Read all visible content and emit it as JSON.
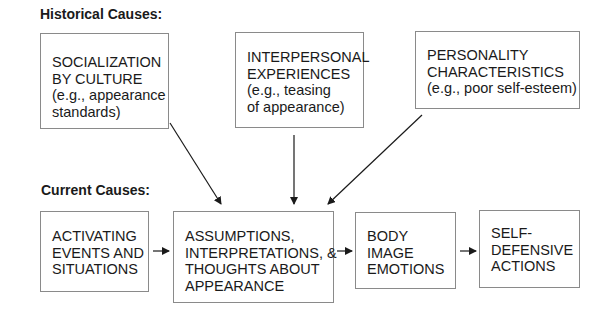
{
  "sections": {
    "historical_label": "Historical Causes:",
    "current_label": "Current Causes:"
  },
  "historical_boxes": [
    {
      "lines": [
        "SOCIALIZATION",
        "BY CULTURE",
        "(e.g., appearance",
        "standards)"
      ]
    },
    {
      "lines": [
        "INTERPERSONAL",
        "EXPERIENCES",
        "(e.g., teasing",
        "of appearance)"
      ]
    },
    {
      "lines": [
        "PERSONALITY",
        "CHARACTERISTICS",
        "(e.g., poor self-esteem)"
      ]
    }
  ],
  "current_boxes": [
    {
      "lines": [
        "ACTIVATING",
        "EVENTS AND",
        "SITUATIONS"
      ]
    },
    {
      "lines": [
        "ASSUMPTIONS,",
        "INTERPRETATIONS, &",
        "THOUGHTS ABOUT",
        "APPEARANCE"
      ]
    },
    {
      "lines": [
        "BODY",
        "IMAGE",
        "EMOTIONS"
      ]
    },
    {
      "lines": [
        "SELF-",
        "DEFENSIVE",
        "ACTIONS"
      ]
    }
  ],
  "colors": {
    "box_border": "#8a8a8a",
    "arrow": "#1a1a1a",
    "text": "#1a1a1a"
  }
}
